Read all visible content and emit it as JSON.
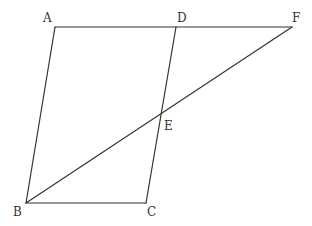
{
  "diagram": {
    "type": "geometry",
    "points": [
      {
        "id": "A",
        "label": "A"
      },
      {
        "id": "B",
        "label": "B"
      },
      {
        "id": "C",
        "label": "C"
      },
      {
        "id": "D",
        "label": "D"
      },
      {
        "id": "E",
        "label": "E"
      },
      {
        "id": "F",
        "label": "F"
      }
    ],
    "segments": [
      {
        "from": "A",
        "to": "F"
      },
      {
        "from": "A",
        "to": "B"
      },
      {
        "from": "B",
        "to": "C"
      },
      {
        "from": "C",
        "to": "D"
      },
      {
        "from": "B",
        "to": "F"
      }
    ],
    "stroke_color": "#333333"
  }
}
